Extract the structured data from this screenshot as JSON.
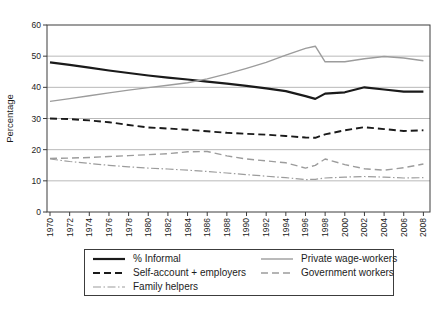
{
  "chart_data": {
    "type": "line",
    "title": "",
    "xlabel": "",
    "ylabel": "Percentage",
    "ylim": [
      0,
      60
    ],
    "ytick_interval": 10,
    "grid": "horizontal",
    "legend_position": "bottom",
    "x_tick_labels": [
      "1970",
      "1972",
      "1974",
      "1976",
      "1978",
      "1980",
      "1982",
      "1984",
      "1986",
      "1988",
      "1990",
      "1992",
      "1994",
      "1996",
      "1998",
      "2000",
      "2002",
      "2004",
      "2006",
      "2008"
    ],
    "x": [
      1970,
      1972,
      1974,
      1976,
      1978,
      1980,
      1982,
      1984,
      1986,
      1988,
      1990,
      1992,
      1994,
      1996,
      1997,
      1998,
      2000,
      2002,
      2004,
      2006,
      2008
    ],
    "series": [
      {
        "name": "% Informal",
        "color": "#1a1a1a",
        "style": "solid",
        "width": 2.2,
        "values": [
          48.0,
          47.2,
          46.3,
          45.4,
          44.6,
          43.8,
          43.1,
          42.5,
          41.8,
          41.2,
          40.5,
          39.7,
          38.8,
          37.2,
          36.3,
          38.0,
          38.4,
          40.0,
          39.3,
          38.6,
          38.6
        ]
      },
      {
        "name": "Private wage-workers",
        "color": "#9c9c9c",
        "style": "solid",
        "width": 1.4,
        "values": [
          35.5,
          36.4,
          37.3,
          38.2,
          39.1,
          39.9,
          40.7,
          41.5,
          42.7,
          44.3,
          46.1,
          48.0,
          50.3,
          52.5,
          53.2,
          48.2,
          48.2,
          49.2,
          49.9,
          49.4,
          48.5
        ]
      },
      {
        "name": "Self-account + employers",
        "color": "#1a1a1a",
        "style": "dashed",
        "width": 1.9,
        "values": [
          30.0,
          29.8,
          29.4,
          28.8,
          27.9,
          27.1,
          26.8,
          26.4,
          25.9,
          25.4,
          25.1,
          24.8,
          24.4,
          23.9,
          23.8,
          24.9,
          26.2,
          27.2,
          26.6,
          26.0,
          26.2
        ]
      },
      {
        "name": "Government workers",
        "color": "#9c9c9c",
        "style": "dashed",
        "width": 1.4,
        "values": [
          17.2,
          17.3,
          17.5,
          17.8,
          18.1,
          18.4,
          18.7,
          19.3,
          19.4,
          18.0,
          17.0,
          16.4,
          15.8,
          14.1,
          15.0,
          17.0,
          15.2,
          13.9,
          13.4,
          14.2,
          15.4
        ]
      },
      {
        "name": "Family helpers",
        "color": "#9c9c9c",
        "style": "dashdot",
        "width": 1.2,
        "values": [
          17.0,
          16.2,
          15.6,
          15.0,
          14.5,
          14.1,
          13.8,
          13.4,
          13.0,
          12.5,
          12.0,
          11.5,
          11.0,
          10.4,
          10.5,
          10.9,
          11.2,
          11.4,
          11.2,
          10.9,
          11.0
        ]
      }
    ],
    "colors": {
      "axis": "#3c3c3c",
      "gridline": "#b9b9b9",
      "tick_text": "#1c1c1c"
    }
  }
}
